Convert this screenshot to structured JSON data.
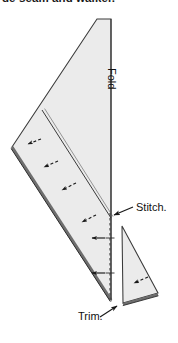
{
  "figure": {
    "title_fragment": "de seam and walker.",
    "kind": "sewing-instruction-diagram",
    "background_color": "#ffffff",
    "fabric_fill_color": "#ebebeb",
    "outline_color": "#3a3a3a",
    "shadow_edge_color": "#6e6e6e",
    "stitch_line_color": "#555555",
    "label_color": "#111111"
  },
  "labels": {
    "fold": "Fold",
    "stitch": "Stitch.",
    "trim": "Trim."
  },
  "shapes": {
    "main_panel_name": "folded-fabric-main-panel",
    "left_flap_name": "fabric-left-flap",
    "small_triangle_name": "trimmed-corner-triangle",
    "fold_edge_name": "fold-edge-line",
    "stitch_line_name": "dashed-stitch-line",
    "crease_line_name": "crease-seam-line"
  },
  "annotations": {
    "grain_arrow_count": 6,
    "stitch_arrow_points_to": "dashed-stitch-line",
    "trim_arrow_points_to": "bottom-corner"
  }
}
